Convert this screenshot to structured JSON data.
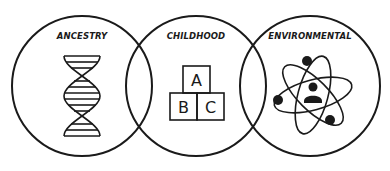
{
  "diagram": {
    "type": "venn",
    "stroke_color": "#1a1a1a",
    "background": "#ffffff",
    "circles": [
      {
        "label": "ANCESTRY",
        "icon": "dna-icon"
      },
      {
        "label": "CHILDHOOD",
        "icon": "abc-blocks-icon",
        "blocks": [
          "A",
          "B",
          "C"
        ]
      },
      {
        "label": "ENVIRONMENTAL",
        "icon": "atom-person-icon"
      }
    ]
  }
}
